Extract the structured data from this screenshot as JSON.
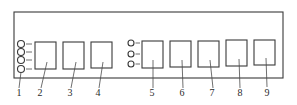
{
  "diagram": {
    "type": "panel-layout-line-drawing",
    "colors": {
      "line": "#3a3a3a",
      "background": "#ffffff",
      "text": "#2a2a2a"
    },
    "frame": {
      "x": 14,
      "y": 12,
      "w": 269,
      "h": 66
    },
    "indicator_groups": [
      {
        "id": "group-left",
        "cx": 21,
        "tick_x2": 32,
        "r": 3.5,
        "cys": [
          44,
          52,
          60,
          69
        ]
      },
      {
        "id": "group-mid",
        "cx": 131,
        "tick_x2": 140,
        "r": 3,
        "cys": [
          43,
          54,
          64
        ]
      }
    ],
    "boxes": [
      {
        "id": "2",
        "x": 35,
        "y": 42,
        "w": 21,
        "h": 27
      },
      {
        "id": "3",
        "x": 63,
        "y": 42,
        "w": 21,
        "h": 27
      },
      {
        "id": "4",
        "x": 91,
        "y": 42,
        "w": 21,
        "h": 26
      },
      {
        "id": "5",
        "x": 142,
        "y": 41,
        "w": 21,
        "h": 27
      },
      {
        "id": "6",
        "x": 170,
        "y": 41,
        "w": 21,
        "h": 26
      },
      {
        "id": "7",
        "x": 198,
        "y": 41,
        "w": 21,
        "h": 26
      },
      {
        "id": "8",
        "x": 226,
        "y": 40,
        "w": 21,
        "h": 26
      },
      {
        "id": "9",
        "x": 254,
        "y": 40,
        "w": 21,
        "h": 25
      }
    ],
    "callouts": [
      {
        "label": "1",
        "text_x": 19,
        "text_y": 96,
        "x1": 21,
        "y1": 72,
        "x2": 19,
        "y2": 88
      },
      {
        "label": "2",
        "text_x": 40,
        "text_y": 96,
        "x1": 47,
        "y1": 62,
        "x2": 41,
        "y2": 88
      },
      {
        "label": "3",
        "text_x": 70,
        "text_y": 96,
        "x1": 76,
        "y1": 62,
        "x2": 71,
        "y2": 88
      },
      {
        "label": "4",
        "text_x": 98,
        "text_y": 96,
        "x1": 103,
        "y1": 62,
        "x2": 99,
        "y2": 88
      },
      {
        "label": "5",
        "text_x": 152,
        "text_y": 96,
        "x1": 153,
        "y1": 60,
        "x2": 153,
        "y2": 88
      },
      {
        "label": "6",
        "text_x": 182,
        "text_y": 96,
        "x1": 182,
        "y1": 60,
        "x2": 183,
        "y2": 88
      },
      {
        "label": "7",
        "text_x": 212,
        "text_y": 96,
        "x1": 210,
        "y1": 60,
        "x2": 213,
        "y2": 88
      },
      {
        "label": "8",
        "text_x": 240,
        "text_y": 96,
        "x1": 239,
        "y1": 59,
        "x2": 240,
        "y2": 88
      },
      {
        "label": "9",
        "text_x": 267,
        "text_y": 96,
        "x1": 266,
        "y1": 58,
        "x2": 267,
        "y2": 87
      }
    ]
  }
}
